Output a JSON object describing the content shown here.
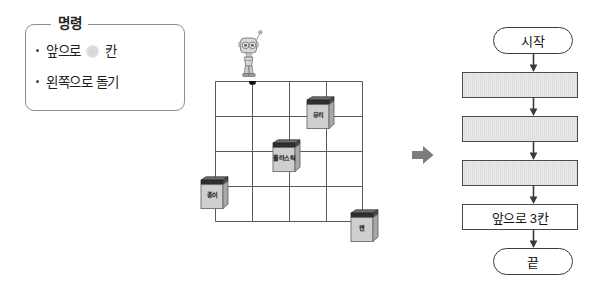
{
  "command_panel": {
    "legend": "명령",
    "items": [
      {
        "prefix": "앞으로",
        "redacted": true,
        "suffix": "칸"
      },
      {
        "prefix": "왼쪽으로 돌기",
        "redacted": false,
        "suffix": ""
      }
    ]
  },
  "grid": {
    "columns": 4,
    "rows": 4,
    "robot": {
      "name": "robot",
      "marker": "start-dot",
      "cell_x": 1,
      "cell_y": 0
    },
    "bins": [
      {
        "id": "glass",
        "label": "유리",
        "cell_x": 2,
        "cell_y": 0
      },
      {
        "id": "plastic",
        "label": "플라스틱",
        "cell_x": 1,
        "cell_y": 1
      },
      {
        "id": "paper",
        "label": "종이",
        "cell_x": 0,
        "cell_y": 2
      },
      {
        "id": "can",
        "label": "캔",
        "cell_x": 3,
        "cell_y": 3
      }
    ]
  },
  "transition": {
    "icon": "arrow-right-icon"
  },
  "flowchart": {
    "nodes": [
      {
        "id": "start",
        "type": "terminal",
        "label": "시작"
      },
      {
        "id": "step1",
        "type": "process",
        "label": ""
      },
      {
        "id": "step2",
        "type": "process",
        "label": ""
      },
      {
        "id": "step3",
        "type": "process",
        "label": ""
      },
      {
        "id": "step4",
        "type": "action",
        "label": "앞으로 3칸"
      },
      {
        "id": "end",
        "type": "terminal",
        "label": "끝"
      }
    ]
  },
  "colors": {
    "panel_border": "#8e8e8e",
    "grid_line": "#5a5a5a",
    "bin_body": "#cfcfcf",
    "bin_lid": "#3a3a3a",
    "process_fill": "#e6e6e6",
    "node_border": "#4a4a4a",
    "arrow_grey": "#7c7c7c"
  }
}
